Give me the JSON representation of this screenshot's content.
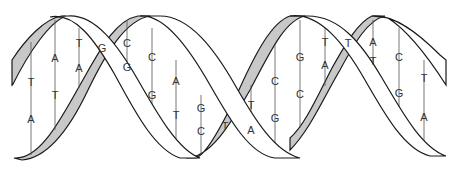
{
  "diagram": {
    "title": "",
    "colors": {
      "background": "#ffffff",
      "strand_outline": "#1a1a1a",
      "backbone_fill_back": "#c8c8c8",
      "backbone_fill_front": "#ffffff",
      "rung": "#555555",
      "label": "#333333"
    },
    "base_pairs": [
      {
        "x": 31,
        "top": "T",
        "bottom": "A",
        "top_y": 82,
        "bottom_y": 119,
        "line": [
          42,
          155
        ]
      },
      {
        "x": 55,
        "top": "A",
        "bottom": "T",
        "top_y": 58,
        "bottom_y": 95,
        "line": [
          20,
          130
        ]
      },
      {
        "x": 79,
        "top": "T",
        "bottom": "A",
        "top_y": 43,
        "bottom_y": 68,
        "line": [
          28,
          88
        ]
      },
      {
        "x": 102,
        "top": "G",
        "bottom": "",
        "top_y": 48,
        "bottom_y": 0,
        "line": [
          0,
          0
        ]
      },
      {
        "x": 127,
        "top": "C",
        "bottom": "G",
        "top_y": 43,
        "bottom_y": 67,
        "line": [
          20,
          75
        ]
      },
      {
        "x": 152,
        "top": "C",
        "bottom": "G",
        "top_y": 57,
        "bottom_y": 95,
        "line": [
          28,
          110
        ]
      },
      {
        "x": 176,
        "top": "A",
        "bottom": "T",
        "top_y": 81,
        "bottom_y": 115,
        "line": [
          60,
          148
        ]
      },
      {
        "x": 201,
        "top": "G",
        "bottom": "C",
        "top_y": 108,
        "bottom_y": 131,
        "line": [
          95,
          155
        ]
      },
      {
        "x": 225,
        "top": "T",
        "bottom": "",
        "top_y": 126,
        "bottom_y": 0,
        "line": [
          0,
          0
        ]
      },
      {
        "x": 251,
        "top": "T",
        "bottom": "A",
        "top_y": 105,
        "bottom_y": 130,
        "line": [
          85,
          145
        ]
      },
      {
        "x": 275,
        "top": "C",
        "bottom": "G",
        "top_y": 81,
        "bottom_y": 118,
        "line": [
          45,
          155
        ]
      },
      {
        "x": 300,
        "top": "G",
        "bottom": "C",
        "top_y": 57,
        "bottom_y": 94,
        "line": [
          20,
          128
        ]
      },
      {
        "x": 325,
        "top": "T",
        "bottom": "A",
        "top_y": 42,
        "bottom_y": 65,
        "line": [
          28,
          86
        ]
      },
      {
        "x": 348,
        "top": "T",
        "bottom": "",
        "top_y": 43,
        "bottom_y": 0,
        "line": [
          0,
          0
        ]
      },
      {
        "x": 373,
        "top": "A",
        "bottom": "T",
        "top_y": 42,
        "bottom_y": 61,
        "line": [
          20,
          70
        ]
      },
      {
        "x": 399,
        "top": "C",
        "bottom": "G",
        "top_y": 57,
        "bottom_y": 93,
        "line": [
          28,
          115
        ]
      },
      {
        "x": 424,
        "top": "T",
        "bottom": "A",
        "top_y": 78,
        "bottom_y": 117,
        "line": [
          60,
          148
        ]
      }
    ],
    "labels": {
      "bp0_top": "T",
      "bp0_bottom": "A",
      "bp1_top": "A",
      "bp1_bottom": "T",
      "bp2_top": "T",
      "bp2_bottom": "A",
      "bp3_top": "G",
      "bp4_top": "C",
      "bp4_bottom": "G",
      "bp5_top": "C",
      "bp5_bottom": "G",
      "bp6_top": "A",
      "bp6_bottom": "T",
      "bp7_top": "G",
      "bp7_bottom": "C",
      "bp8_top": "T",
      "bp9_top": "T",
      "bp9_bottom": "A",
      "bp10_top": "C",
      "bp10_bottom": "G",
      "bp11_top": "G",
      "bp11_bottom": "C",
      "bp12_top": "T",
      "bp12_bottom": "A",
      "bp13_top": "T",
      "bp14_top": "A",
      "bp14_bottom": "T",
      "bp15_top": "C",
      "bp15_bottom": "G",
      "bp16_top": "T",
      "bp16_bottom": "A"
    }
  }
}
